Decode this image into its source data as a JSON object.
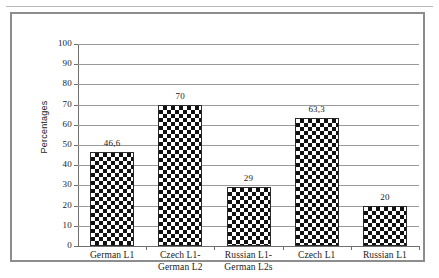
{
  "page": {
    "header_rule": true
  },
  "chart_data": {
    "type": "bar",
    "title": "",
    "xlabel": "",
    "ylabel": "Percentages",
    "ylim": [
      0,
      100
    ],
    "ytick_step": 10,
    "ytick_labels": [
      "100",
      "90",
      "80",
      "70",
      "60",
      "50",
      "40",
      "30",
      "20",
      "10",
      "0"
    ],
    "grid": true,
    "legend": "none",
    "categories": [
      "German L1",
      "Czech L1-German L2",
      "Russian L1-German L2s",
      "Czech L1",
      "Russian L1"
    ],
    "category_lines": [
      [
        "German L1"
      ],
      [
        "Czech L1-",
        "German L2"
      ],
      [
        "Russian L1-",
        "German L2s"
      ],
      [
        "Czech L1"
      ],
      [
        "Russian L1"
      ]
    ],
    "values": [
      46.6,
      70,
      29,
      63.3,
      20
    ],
    "value_labels": [
      "46,6",
      "70",
      "29",
      "63,3",
      "20"
    ],
    "bar_fill": "black-white-checkerboard",
    "colors": {
      "bar_dark": "#111111",
      "bar_light": "#ffffff",
      "bar_outline": "#2a2a2a",
      "gridline": "#9a9a9a",
      "axis": "#6f6f6f",
      "frame": "#8d8d8d",
      "text": "#1a1a1a"
    }
  }
}
